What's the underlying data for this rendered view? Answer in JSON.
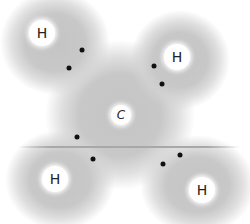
{
  "diagram": {
    "central_atom": {
      "label": "C",
      "x": 121,
      "y": 115
    },
    "hydrogens": [
      {
        "label": "H",
        "x": 42,
        "y": 33
      },
      {
        "label": "H",
        "x": 177,
        "y": 57
      },
      {
        "label": "H",
        "x": 55,
        "y": 179
      },
      {
        "label": "H",
        "x": 202,
        "y": 190
      }
    ],
    "electrons": [
      {
        "x": 82,
        "y": 50
      },
      {
        "x": 69,
        "y": 68
      },
      {
        "x": 154,
        "y": 66
      },
      {
        "x": 162,
        "y": 84
      },
      {
        "x": 77,
        "y": 137
      },
      {
        "x": 93,
        "y": 159
      },
      {
        "x": 180,
        "y": 155
      },
      {
        "x": 163,
        "y": 164
      }
    ],
    "colors": {
      "cloud": "#c4c4c4",
      "electron": "#111111",
      "atom": "#ffffff"
    }
  }
}
